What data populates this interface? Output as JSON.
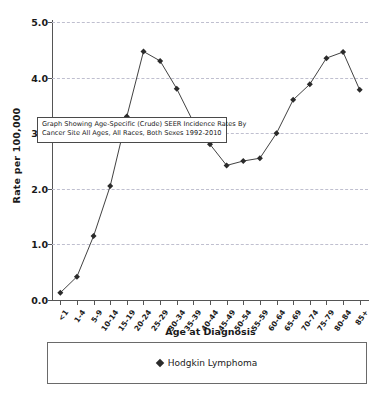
{
  "chart_data": {
    "type": "line",
    "title": "",
    "xlabel": "Age at Diagnosis",
    "ylabel": "Rate per 100,000",
    "ylim": [
      0.0,
      5.0
    ],
    "ytick_step": 1.0,
    "grid": true,
    "legend_position": "bottom",
    "categories": [
      "<1",
      "1-4",
      "5-9",
      "10-14",
      "15-19",
      "20-24",
      "25-29",
      "30-34",
      "35-39",
      "40-44",
      "45-49",
      "50-54",
      "55-59",
      "60-64",
      "65-69",
      "70-74",
      "75-79",
      "80-84",
      "85+"
    ],
    "ytick_labels": [
      "5.0",
      "4.0",
      "3.0",
      "2.0",
      "1.0",
      "0.0"
    ],
    "ytick_values": [
      5.0,
      4.0,
      3.0,
      2.0,
      1.0,
      0.0
    ],
    "series": [
      {
        "name": "Hodgkin Lymphoma",
        "color": "#2b2b2b",
        "marker": "diamond",
        "values": [
          0.13,
          0.42,
          1.15,
          2.05,
          3.3,
          4.47,
          4.3,
          3.8,
          3.2,
          2.8,
          2.42,
          2.5,
          2.55,
          3.0,
          3.6,
          3.88,
          4.35,
          4.46,
          3.78
        ]
      }
    ]
  },
  "tooltip": {
    "line1": "Graph Showing Age-Specific (Crude) SEER Incidence Rates By",
    "line2": "Cancer Site All Ages, All Races, Both Sexes 1992-2010"
  },
  "legend": {
    "items": [
      {
        "label": "Hodgkin Lymphoma"
      }
    ]
  },
  "colors": {
    "series": "#2b2b2b",
    "grid": "#bfbfcf",
    "axis": "#555555",
    "background": "#ffffff"
  }
}
